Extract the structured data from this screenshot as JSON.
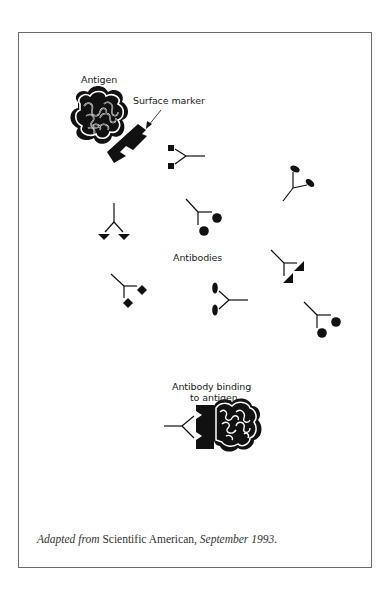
{
  "figure": {
    "labels": {
      "antigen": "Antigen",
      "surface_marker": "Surface marker",
      "antibodies": "Antibodies",
      "binding_line1": "Antibody binding",
      "binding_line2": "to antigen"
    },
    "antibodies": [
      {
        "shape": "square",
        "position": "upper-center"
      },
      {
        "shape": "ellipse",
        "position": "upper-right"
      },
      {
        "shape": "triangle",
        "position": "left"
      },
      {
        "shape": "circle",
        "position": "center"
      },
      {
        "shape": "right-triangle",
        "position": "right"
      },
      {
        "shape": "diamond",
        "position": "lower-left"
      },
      {
        "shape": "ellipse",
        "position": "lower-center"
      },
      {
        "shape": "circle",
        "position": "lower-right"
      }
    ],
    "colors": {
      "ink": "#111111",
      "frame": "#6a6a6a",
      "text": "#222222"
    }
  },
  "caption": {
    "italic_prefix": "Adapted from",
    "source": " Scientific American, ",
    "italic_date": "September 1993",
    "suffix": "."
  }
}
